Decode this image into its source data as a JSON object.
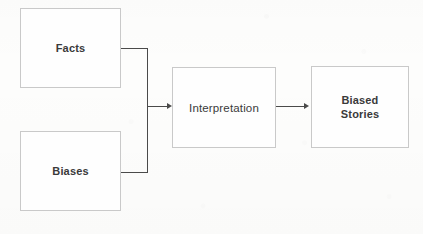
{
  "diagram": {
    "type": "flowchart",
    "background_color": "#fdfdfc",
    "node_border_color": "#c9c9c9",
    "node_fill_color": "#fefefe",
    "text_color": "#3a3a3a",
    "connector_color": "#4a4a4a",
    "nodes": [
      {
        "id": "facts",
        "label": "Facts",
        "weight": "bold"
      },
      {
        "id": "biases",
        "label": "Biases",
        "weight": "bold"
      },
      {
        "id": "interpretation",
        "label": "Interpretation",
        "weight": "regular"
      },
      {
        "id": "biased_stories",
        "label": "Biased\nStories",
        "weight": "bold"
      }
    ],
    "edges": [
      {
        "id": "facts_to_interpretation",
        "from": "facts",
        "to": "interpretation",
        "arrow": true
      },
      {
        "id": "biases_to_interpretation",
        "from": "biases",
        "to": "interpretation",
        "arrow": true
      },
      {
        "id": "interpretation_to_biased_stories",
        "from": "interpretation",
        "to": "biased_stories",
        "arrow": true
      }
    ]
  }
}
